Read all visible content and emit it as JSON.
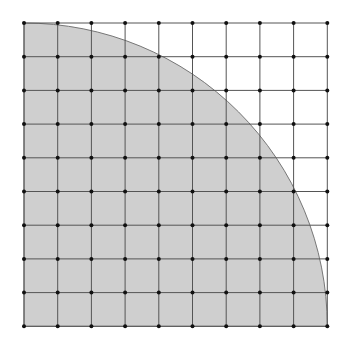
{
  "diagram": {
    "type": "quarter-circle-on-grid",
    "grid": {
      "cells_x": 9,
      "cells_y": 9,
      "lines_x": 10,
      "lines_y": 10,
      "origin_x": 24,
      "origin_y": 23,
      "spacing": 33.7,
      "line_color": "#555555",
      "dot_color": "#111111"
    },
    "quarter_circle": {
      "center": "bottom-left",
      "radius_cells": 9,
      "fill_color": "#cfcfcf",
      "stroke_color": "#777777"
    }
  }
}
